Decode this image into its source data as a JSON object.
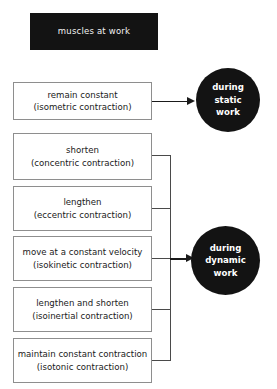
{
  "diagram": {
    "title": "muscles at work",
    "colors": {
      "title_bar_bg": "#131313",
      "title_text": "#f2f2f2",
      "box_border": "#8e8e8e",
      "box_bg": "#ffffff",
      "box_text": "#1a1a1a",
      "circle_bg": "#131313",
      "circle_text": "#ffffff",
      "connector": "#4a4a4a",
      "arrow": "#1a1a1a",
      "page_bg": "#ffffff"
    },
    "static_group": {
      "circle_lines": [
        "during",
        "static",
        "work"
      ],
      "boxes": [
        {
          "primary": "remain constant",
          "secondary": "(isometric contraction)"
        }
      ]
    },
    "dynamic_group": {
      "circle_lines": [
        "during",
        "dynamic",
        "work"
      ],
      "boxes": [
        {
          "primary": "shorten",
          "secondary": "(concentric contraction)"
        },
        {
          "primary": "lengthen",
          "secondary": "(eccentric contraction)"
        },
        {
          "primary": "move at a constant velocity",
          "secondary": "(isokinetic contraction)"
        },
        {
          "primary": "lengthen and shorten",
          "secondary": "(isoinertial contraction)"
        },
        {
          "primary": "maintain constant contraction",
          "secondary": "(isotonic contraction)"
        }
      ]
    }
  }
}
